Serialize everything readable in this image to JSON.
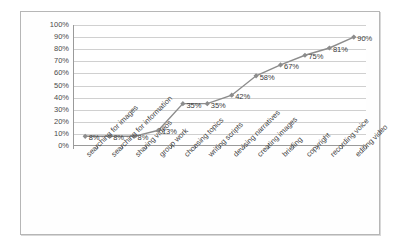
{
  "chart_data": {
    "type": "line",
    "title": "",
    "xlabel": "",
    "ylabel": "",
    "ylim": [
      0,
      100
    ],
    "ytick_labels": [
      "100%",
      "90%",
      "80%",
      "70%",
      "60%",
      "50%",
      "40%",
      "30%",
      "20%",
      "10%",
      "0%"
    ],
    "ytick_values": [
      100,
      90,
      80,
      70,
      60,
      50,
      40,
      30,
      20,
      10,
      0
    ],
    "grid": true,
    "legend": "none",
    "categories": [
      "searching for images",
      "searching for information",
      "sharing videos",
      "group work",
      "choosing topics",
      "writing scripts",
      "devising narratives",
      "creating images",
      "briefing",
      "copyright",
      "recording voice",
      "editing video"
    ],
    "values": [
      8,
      8,
      8,
      13,
      35,
      35,
      42,
      58,
      67,
      75,
      81,
      90
    ],
    "point_labels": [
      "8%",
      "8%",
      "8%",
      "13%",
      "35%",
      "35%",
      "42%",
      "58%",
      "67%",
      "75%",
      "81%",
      "90%"
    ],
    "series_color": "#8c8c8c",
    "marker": "diamond"
  },
  "frame": {
    "border_color": "#b6b6b6"
  }
}
